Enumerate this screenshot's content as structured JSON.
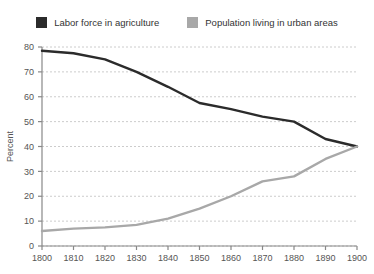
{
  "legend": {
    "items": [
      {
        "label": "Labor force in agriculture",
        "color": "#2b2b2b",
        "icon": "legend-swatch-square"
      },
      {
        "label": "Population living in urban areas",
        "color": "#a8a8a8",
        "icon": "legend-swatch-square"
      }
    ]
  },
  "chart_data": {
    "type": "line",
    "title": "",
    "xlabel": "",
    "ylabel": "Percent",
    "xlim": [
      1800,
      1900
    ],
    "ylim": [
      0,
      80
    ],
    "grid": true,
    "legend_position": "top",
    "categories": [
      1800,
      1810,
      1820,
      1830,
      1840,
      1850,
      1860,
      1870,
      1880,
      1890,
      1900
    ],
    "x_tick_labels": [
      "1800",
      "1810",
      "1820",
      "1830",
      "1840",
      "1850",
      "1860",
      "1870",
      "1880",
      "1890",
      "1900"
    ],
    "y_ticks": [
      0,
      10,
      20,
      30,
      40,
      50,
      60,
      70,
      80
    ],
    "y_tick_labels": [
      "0",
      "10",
      "20",
      "30",
      "40",
      "50",
      "60",
      "70",
      "80"
    ],
    "series": [
      {
        "name": "Labor force in agriculture",
        "color": "#2b2b2b",
        "values": [
          78.5,
          77.5,
          75,
          70,
          64,
          57.5,
          55,
          52,
          50,
          43,
          40
        ]
      },
      {
        "name": "Population living in urban areas",
        "color": "#a8a8a8",
        "values": [
          6,
          7,
          7.5,
          8.5,
          11,
          15,
          20,
          26,
          28,
          35,
          40
        ]
      }
    ]
  }
}
